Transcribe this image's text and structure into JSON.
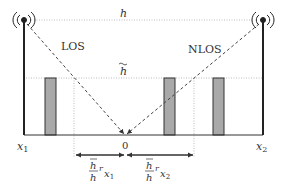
{
  "diagram": {
    "labels": {
      "h": "h",
      "h_tilde": "h",
      "los": "LOS",
      "nlos": "NLOS",
      "x1": "x",
      "x1_sub": "1",
      "x2": "x",
      "x2_sub": "2",
      "origin": "0",
      "left_span_num": "h",
      "left_span_den": "h",
      "left_span_r": "r",
      "left_span_x": "x",
      "left_span_sub": "1",
      "right_span_num": "h",
      "right_span_den": "h",
      "right_span_r": "r",
      "right_span_x": "x",
      "right_span_sub": "2"
    },
    "colors": {
      "tower": "#222222",
      "building_fill": "#a9a9a9",
      "building_stroke": "#333333",
      "dotted": "#bbbbbb",
      "dashed": "#444444"
    },
    "elements": {
      "towers": [
        "left-antenna-tower",
        "right-antenna-tower"
      ],
      "buildings": [
        "building-1",
        "building-2",
        "building-3"
      ]
    }
  }
}
